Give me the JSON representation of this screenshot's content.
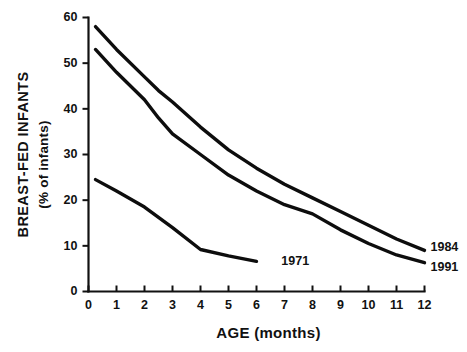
{
  "chart_data": {
    "type": "line",
    "title": "",
    "xlabel": "AGE (months)",
    "ylabel": "BREAST-FED INFANTS",
    "ylabel_sub": "(% of infants)",
    "xlim": [
      0,
      12
    ],
    "ylim": [
      0,
      60
    ],
    "xticks": [
      0,
      1,
      2,
      3,
      4,
      5,
      6,
      7,
      8,
      9,
      10,
      11,
      12
    ],
    "xtick_labels": [
      "0",
      "1",
      "2",
      "3",
      "4",
      "5",
      "6",
      "7",
      "8",
      "9",
      "10",
      "11",
      "12"
    ],
    "yticks": [
      0,
      10,
      20,
      30,
      40,
      50,
      60
    ],
    "ytick_labels": [
      "0",
      "10",
      "20",
      "30",
      "40",
      "50",
      "60"
    ],
    "grid": false,
    "legend_position": "line-end-labels",
    "line_color": "#0d0d0d",
    "series": [
      {
        "name": "1984",
        "label": "1984",
        "x": [
          0.25,
          1,
          2,
          2.5,
          3,
          4,
          5,
          6,
          7,
          8,
          9,
          10,
          11,
          12
        ],
        "values": [
          58,
          53,
          47,
          44,
          41.5,
          36,
          31,
          27,
          23.5,
          20.5,
          17.5,
          14.5,
          11.5,
          9
        ]
      },
      {
        "name": "1991",
        "label": "1991",
        "x": [
          0.25,
          1,
          2,
          2.5,
          3,
          4,
          5,
          6,
          7,
          8,
          9,
          10,
          11,
          12
        ],
        "values": [
          53,
          48,
          42,
          38,
          34.5,
          30,
          25.5,
          22,
          19,
          17,
          13.5,
          10.5,
          8,
          6.3
        ]
      },
      {
        "name": "1971",
        "label": "1971",
        "x": [
          0.25,
          1,
          2,
          3,
          4,
          5,
          6
        ],
        "values": [
          24.5,
          22,
          18.5,
          14,
          9.2,
          7.8,
          6.6
        ]
      }
    ],
    "series_labels": [
      {
        "text": "1984",
        "x": 12.4,
        "y": 9.5
      },
      {
        "text": "1991",
        "x": 12.4,
        "y": 5.2
      },
      {
        "text": "1971",
        "x": 6.6,
        "y": 6.6
      }
    ]
  }
}
